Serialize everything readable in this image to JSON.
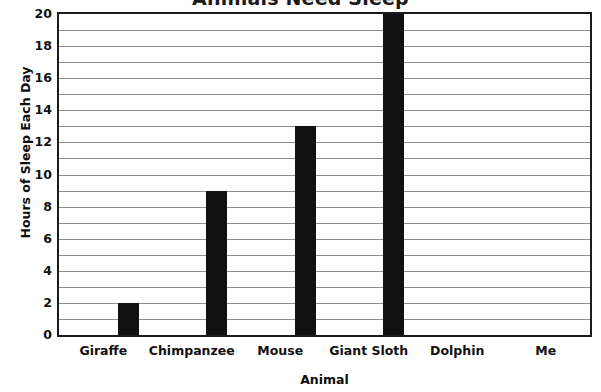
{
  "chart_data": {
    "type": "bar",
    "title": "Animals Need Sleep",
    "xlabel": "Animal",
    "ylabel": "Hours of Sleep Each Day",
    "categories": [
      "Giraffe",
      "Chimpanzee",
      "Mouse",
      "Giant Sloth",
      "Dolphin",
      "Me"
    ],
    "values": [
      2,
      9,
      13,
      20,
      0,
      0
    ],
    "ylim": [
      0,
      20
    ],
    "ytick_labels": [
      "0",
      "2",
      "4",
      "6",
      "8",
      "10",
      "12",
      "14",
      "16",
      "18",
      "20"
    ],
    "ytick_values": [
      0,
      2,
      4,
      6,
      8,
      10,
      12,
      14,
      16,
      18,
      20
    ],
    "ytick_step": 2,
    "gridline_step": 1,
    "grid": true,
    "legend": false,
    "bar_color": "#111111",
    "grid_color": "#8d8d8d",
    "axis_color": "#1b1b1b",
    "background_color": "#ffffff"
  }
}
